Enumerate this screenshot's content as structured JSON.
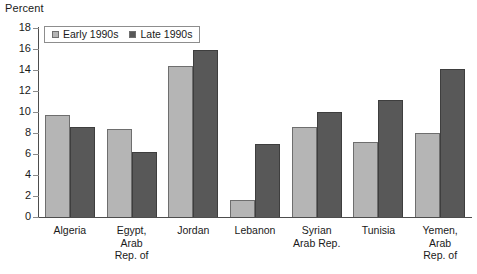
{
  "chart_data": {
    "type": "bar",
    "title": "",
    "subtitle": "",
    "xlabel": "",
    "ylabel": "Percent",
    "ylim": [
      0,
      18
    ],
    "yticks": [
      0,
      2,
      4,
      6,
      8,
      10,
      12,
      14,
      16,
      18
    ],
    "grid": false,
    "legend_position": "top-left",
    "categories": [
      "Algeria",
      "Egypt, Arab Rep. of",
      "Jordan",
      "Lebanon",
      "Syrian Arab Rep.",
      "Tunisia",
      "Yemen, Arab Rep. of"
    ],
    "category_lines": [
      [
        "Algeria"
      ],
      [
        "Egypt,",
        "Arab",
        "Rep. of"
      ],
      [
        "Jordan"
      ],
      [
        "Lebanon"
      ],
      [
        "Syrian",
        "Arab Rep."
      ],
      [
        "Tunisia"
      ],
      [
        "Yemen,",
        "Arab",
        "Rep. of"
      ]
    ],
    "series": [
      {
        "name": "Early 1990s",
        "color": "#b5b5b5",
        "values": [
          9.7,
          8.4,
          14.4,
          1.6,
          8.6,
          7.1,
          8.0
        ]
      },
      {
        "name": "Late 1990s",
        "color": "#585858",
        "values": [
          8.6,
          6.2,
          15.9,
          7.0,
          10.0,
          11.1,
          14.1
        ]
      }
    ]
  },
  "axis": {
    "y_title": "Percent",
    "tick_labels": [
      "18",
      "16",
      "14",
      "12",
      "10",
      "8",
      "6",
      "4",
      "2",
      "0"
    ]
  },
  "legend": {
    "items": [
      {
        "label": "Early 1990s",
        "color": "#b5b5b5"
      },
      {
        "label": "Late 1990s",
        "color": "#585858"
      }
    ]
  },
  "colors": {
    "early": "#b5b5b5",
    "late": "#585858",
    "axis": "#4d4d4d",
    "background": "#ffffff"
  }
}
